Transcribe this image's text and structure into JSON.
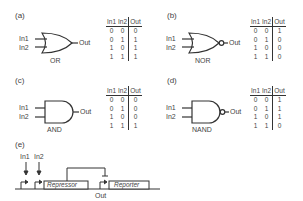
{
  "panels": {
    "a": {
      "label": "(a)",
      "gate": "OR",
      "in1": "In1",
      "in2": "In2",
      "out": "Out",
      "headers": [
        "In1",
        "In2",
        "Out"
      ],
      "rows": [
        [
          "0",
          "0",
          "0"
        ],
        [
          "0",
          "1",
          "1"
        ],
        [
          "1",
          "0",
          "1"
        ],
        [
          "1",
          "1",
          "1"
        ]
      ]
    },
    "b": {
      "label": "(b)",
      "gate": "NOR",
      "in1": "In1",
      "in2": "In2",
      "out": "Out",
      "headers": [
        "In1",
        "In2",
        "Out"
      ],
      "rows": [
        [
          "0",
          "0",
          "1"
        ],
        [
          "0",
          "1",
          "0"
        ],
        [
          "1",
          "0",
          "0"
        ],
        [
          "1",
          "1",
          "0"
        ]
      ]
    },
    "c": {
      "label": "(c)",
      "gate": "AND",
      "in1": "In1",
      "in2": "In2",
      "out": "Out",
      "headers": [
        "In1",
        "In2",
        "Out"
      ],
      "rows": [
        [
          "0",
          "0",
          "0"
        ],
        [
          "0",
          "1",
          "0"
        ],
        [
          "1",
          "0",
          "0"
        ],
        [
          "1",
          "1",
          "1"
        ]
      ]
    },
    "d": {
      "label": "(d)",
      "gate": "NAND",
      "in1": "In1",
      "in2": "In2",
      "out": "Out",
      "headers": [
        "In1",
        "In2",
        "Out"
      ],
      "rows": [
        [
          "0",
          "0",
          "1"
        ],
        [
          "0",
          "1",
          "1"
        ],
        [
          "1",
          "0",
          "1"
        ],
        [
          "1",
          "1",
          "0"
        ]
      ]
    },
    "e": {
      "label": "(e)",
      "in1": "In1",
      "in2": "In2",
      "repressor": "Repressor",
      "reporter": "Reporter",
      "out": "Out"
    }
  }
}
